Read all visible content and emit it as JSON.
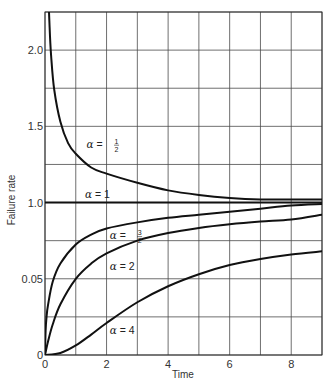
{
  "chart_data": {
    "type": "line",
    "title": "",
    "xlabel": "Time",
    "ylabel": "Failure rate",
    "xlim": [
      0,
      9
    ],
    "ylim": [
      0,
      2.25
    ],
    "grid": true,
    "x_gridlines": [
      0,
      1,
      2,
      3,
      4,
      5,
      6,
      7,
      8,
      9
    ],
    "y_gridlines": [
      0,
      0.25,
      0.5,
      0.75,
      1.0,
      1.25,
      1.5,
      1.75,
      2.0,
      2.25
    ],
    "x_ticks": [
      {
        "value": 0,
        "label": "0"
      },
      {
        "value": 2,
        "label": "2"
      },
      {
        "value": 4,
        "label": "4"
      },
      {
        "value": 6,
        "label": "6"
      },
      {
        "value": 8,
        "label": "8"
      }
    ],
    "y_ticks": [
      {
        "value": 0,
        "label": "0"
      },
      {
        "value": 0.5,
        "label": "0.05"
      },
      {
        "value": 1.0,
        "label": "1.0"
      },
      {
        "value": 1.5,
        "label": "1.5"
      },
      {
        "value": 2.0,
        "label": "2.0"
      }
    ],
    "series": [
      {
        "name": "alpha-1-2",
        "label_prefix": "α = ",
        "label_num": "1",
        "label_den": "2",
        "label_at": [
          1.35,
          1.36
        ],
        "x": [
          0.1,
          0.15,
          0.2,
          0.3,
          0.5,
          0.75,
          1,
          1.5,
          2,
          3,
          4,
          5,
          6,
          7,
          8,
          9
        ],
        "y": [
          2.47,
          2.15,
          1.96,
          1.74,
          1.53,
          1.39,
          1.32,
          1.23,
          1.19,
          1.13,
          1.08,
          1.05,
          1.03,
          1.02,
          1.02,
          1.02
        ]
      },
      {
        "name": "alpha-1",
        "label_prefix": "α = 1",
        "label_num": "",
        "label_den": "",
        "label_at": [
          1.3,
          1.03
        ],
        "x": [
          0,
          9
        ],
        "y": [
          1.0,
          1.0
        ]
      },
      {
        "name": "alpha-3-2",
        "label_prefix": "α = ",
        "label_num": "3",
        "label_den": "2",
        "label_at": [
          2.1,
          0.76
        ],
        "x": [
          0,
          0.02,
          0.05,
          0.1,
          0.25,
          0.5,
          1,
          1.5,
          2,
          3,
          4,
          5,
          6,
          7,
          8,
          9
        ],
        "y": [
          0,
          0.16,
          0.25,
          0.33,
          0.48,
          0.6,
          0.725,
          0.79,
          0.83,
          0.87,
          0.9,
          0.92,
          0.94,
          0.96,
          0.98,
          0.99
        ]
      },
      {
        "name": "alpha-2",
        "label_prefix": "α = 2",
        "label_num": "",
        "label_den": "",
        "label_at": [
          2.1,
          0.56
        ],
        "x": [
          0,
          0.1,
          0.25,
          0.5,
          1,
          1.5,
          2,
          3,
          4,
          5,
          6,
          7,
          8,
          9
        ],
        "y": [
          0,
          0.09,
          0.2,
          0.333,
          0.5,
          0.6,
          0.667,
          0.75,
          0.8,
          0.833,
          0.857,
          0.875,
          0.889,
          0.92
        ]
      },
      {
        "name": "alpha-4",
        "label_prefix": "α = 4",
        "label_num": "",
        "label_den": "",
        "label_at": [
          2.1,
          0.14
        ],
        "x": [
          0,
          0.5,
          1,
          1.5,
          2,
          3,
          4,
          5,
          6,
          7,
          8,
          9
        ],
        "y": [
          0,
          0.013,
          0.0625,
          0.134,
          0.21,
          0.346,
          0.451,
          0.53,
          0.59,
          0.63,
          0.66,
          0.68
        ]
      }
    ]
  }
}
